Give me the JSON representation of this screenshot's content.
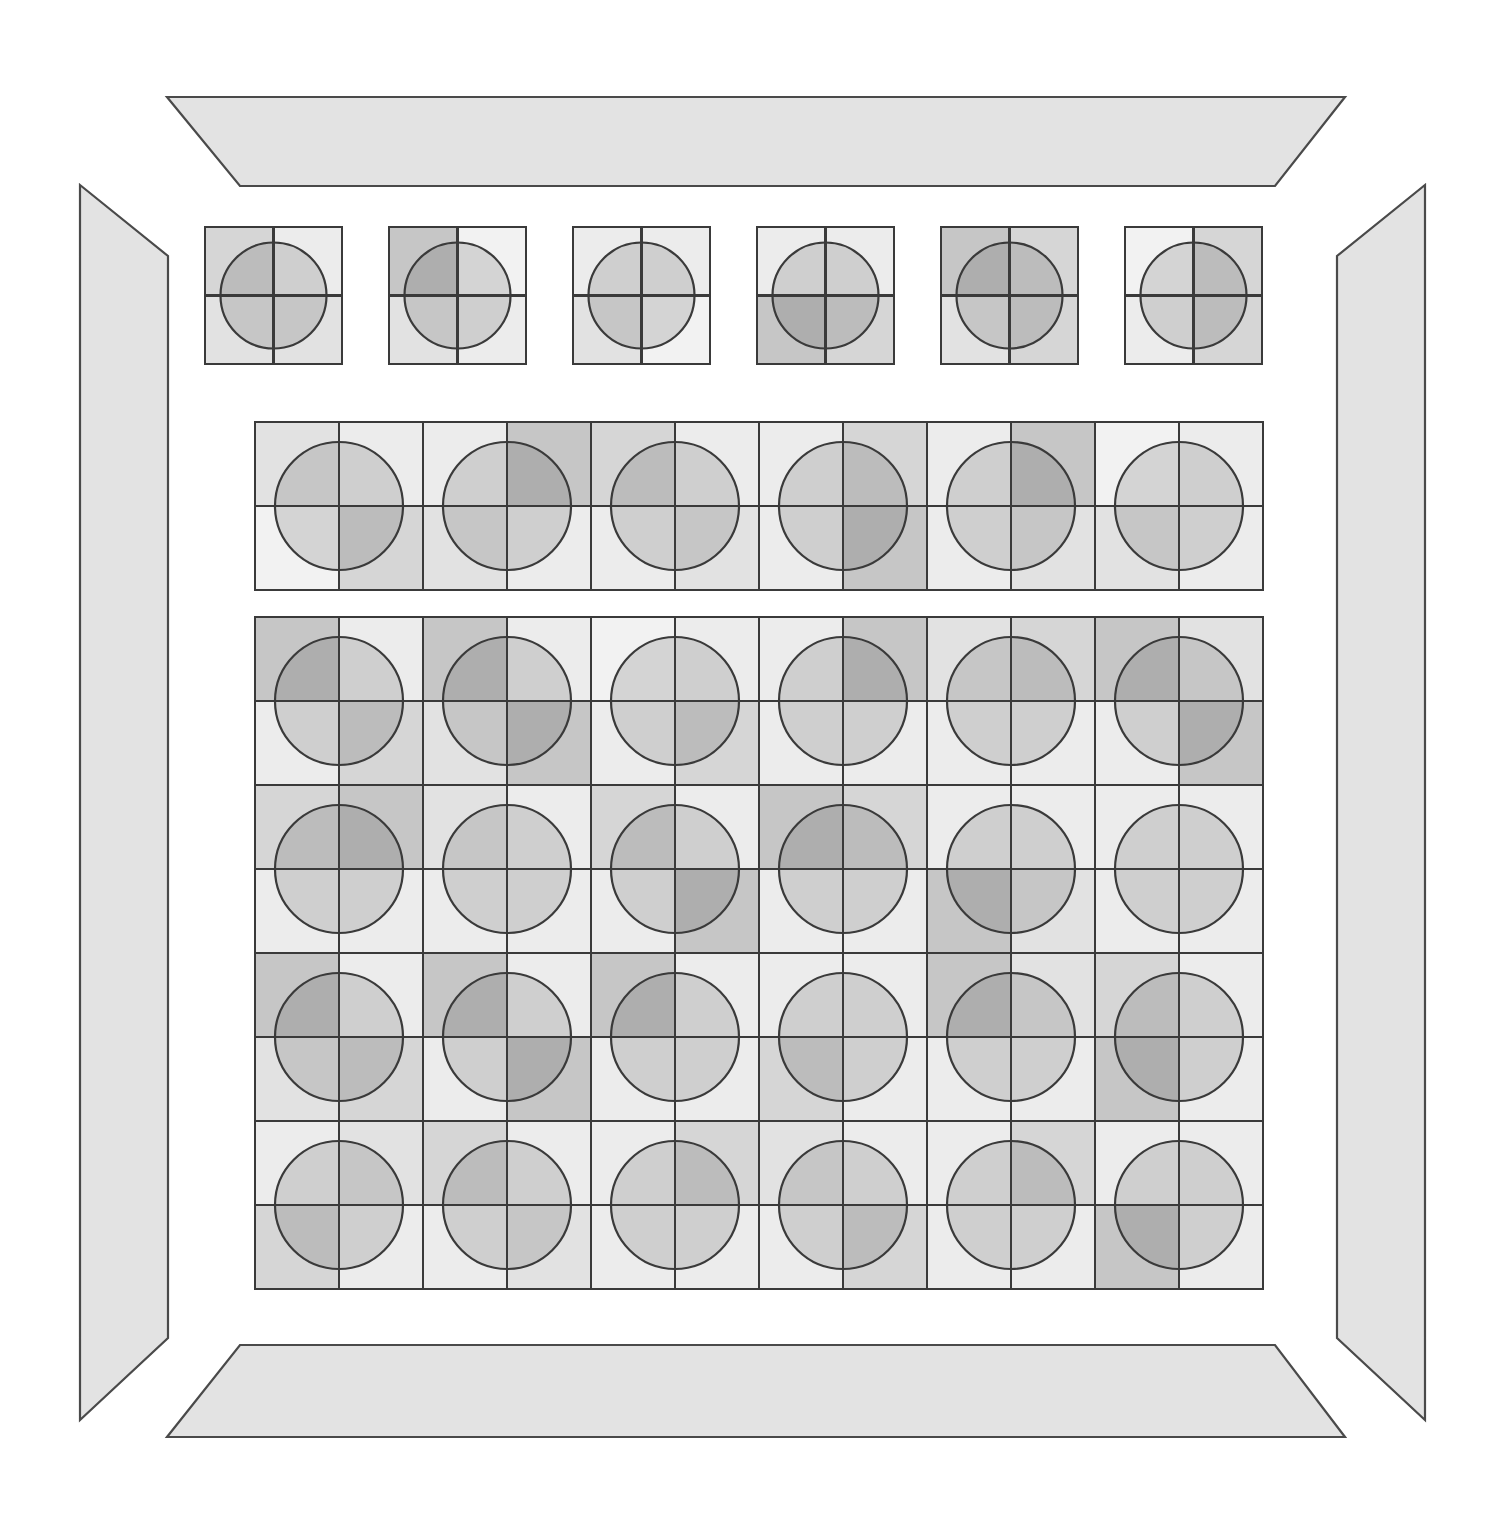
{
  "artwork": {
    "title": "Quadrant Circle Grid Composition",
    "background_color": "#ffffff",
    "canvas": {
      "width": 1507,
      "height": 1522
    }
  },
  "palette": {
    "stroke": "#3a3a3a",
    "frame_fill": "#e3e3e3",
    "frame_stroke": "#4a4a4a",
    "tone_names": [
      "t0",
      "t1",
      "t2",
      "t3",
      "t4",
      "t5"
    ],
    "tones": {
      "t0": "#f2f2f2",
      "t1": "#ececec",
      "t2": "#e2e2e2",
      "t3": "#d6d6d6",
      "t4": "#c6c6c6",
      "t5": "#b2b2b2"
    },
    "circle_darken_alpha": 0.12,
    "circle_stroke": "#3a3a3a",
    "circle_stroke_width": 2.2
  },
  "frame": {
    "label": "picture-frame",
    "pieces": [
      {
        "name": "frame-top",
        "points": "167,97 1345,97 1275,186 240,186"
      },
      {
        "name": "frame-left",
        "points": "80,185 168,256 168,1338 80,1420"
      },
      {
        "name": "frame-right",
        "points": "1425,185 1425,1420 1337,1338 1337,256"
      },
      {
        "name": "frame-bottom",
        "points": "240,1345 1275,1345 1345,1437 167,1437"
      }
    ]
  },
  "bands": [
    {
      "name": "band-top-detached",
      "layout": "detached",
      "x": 205,
      "y": 227,
      "cell": 137,
      "gap": 47,
      "cols": 6,
      "rows": 1,
      "circle_radius": 53,
      "cells": [
        {
          "q": [
            "t3",
            "t1",
            "t2",
            "t2"
          ]
        },
        {
          "q": [
            "t4",
            "t0",
            "t2",
            "t1"
          ]
        },
        {
          "q": [
            "t1",
            "t1",
            "t2",
            "t0"
          ]
        },
        {
          "q": [
            "t1",
            "t1",
            "t4",
            "t3"
          ]
        },
        {
          "q": [
            "t4",
            "t3",
            "t2",
            "t3"
          ]
        },
        {
          "q": [
            "t0",
            "t3",
            "t1",
            "t3"
          ]
        }
      ]
    },
    {
      "name": "band-middle",
      "layout": "contiguous",
      "x": 255,
      "y": 422,
      "cell": 168,
      "gap": 0,
      "cols": 6,
      "rows": 1,
      "circle_radius": 64,
      "cells": [
        {
          "q": [
            "t2",
            "t1",
            "t0",
            "t3"
          ]
        },
        {
          "q": [
            "t1",
            "t4",
            "t2",
            "t1"
          ]
        },
        {
          "q": [
            "t3",
            "t1",
            "t1",
            "t2"
          ]
        },
        {
          "q": [
            "t1",
            "t3",
            "t1",
            "t4"
          ]
        },
        {
          "q": [
            "t1",
            "t4",
            "t1",
            "t2"
          ]
        },
        {
          "q": [
            "t0",
            "t1",
            "t2",
            "t1"
          ]
        }
      ]
    },
    {
      "name": "band-main",
      "layout": "contiguous",
      "x": 255,
      "y": 617,
      "cell": 168,
      "gap": 0,
      "cols": 6,
      "rows": 4,
      "circle_radius": 64,
      "cells": [
        {
          "q": [
            "t4",
            "t1",
            "t1",
            "t3"
          ]
        },
        {
          "q": [
            "t4",
            "t1",
            "t2",
            "t4"
          ]
        },
        {
          "q": [
            "t0",
            "t1",
            "t1",
            "t3"
          ]
        },
        {
          "q": [
            "t1",
            "t4",
            "t1",
            "t1"
          ]
        },
        {
          "q": [
            "t2",
            "t3",
            "t1",
            "t1"
          ]
        },
        {
          "q": [
            "t4",
            "t2",
            "t1",
            "t4"
          ]
        },
        {
          "q": [
            "t3",
            "t4",
            "t1",
            "t1"
          ]
        },
        {
          "q": [
            "t2",
            "t1",
            "t1",
            "t1"
          ]
        },
        {
          "q": [
            "t3",
            "t1",
            "t1",
            "t4"
          ]
        },
        {
          "q": [
            "t4",
            "t3",
            "t1",
            "t1"
          ]
        },
        {
          "q": [
            "t1",
            "t1",
            "t4",
            "t2"
          ]
        },
        {
          "q": [
            "t1",
            "t1",
            "t1",
            "t1"
          ]
        },
        {
          "q": [
            "t4",
            "t1",
            "t2",
            "t3"
          ]
        },
        {
          "q": [
            "t4",
            "t1",
            "t1",
            "t4"
          ]
        },
        {
          "q": [
            "t4",
            "t1",
            "t1",
            "t1"
          ]
        },
        {
          "q": [
            "t1",
            "t1",
            "t3",
            "t1"
          ]
        },
        {
          "q": [
            "t4",
            "t2",
            "t1",
            "t1"
          ]
        },
        {
          "q": [
            "t3",
            "t1",
            "t4",
            "t1"
          ]
        },
        {
          "q": [
            "t1",
            "t2",
            "t3",
            "t1"
          ]
        },
        {
          "q": [
            "t3",
            "t1",
            "t1",
            "t2"
          ]
        },
        {
          "q": [
            "t1",
            "t3",
            "t1",
            "t1"
          ]
        },
        {
          "q": [
            "t2",
            "t1",
            "t1",
            "t3"
          ]
        },
        {
          "q": [
            "t1",
            "t3",
            "t1",
            "t1"
          ]
        },
        {
          "q": [
            "t1",
            "t1",
            "t4",
            "t1"
          ]
        }
      ]
    }
  ]
}
